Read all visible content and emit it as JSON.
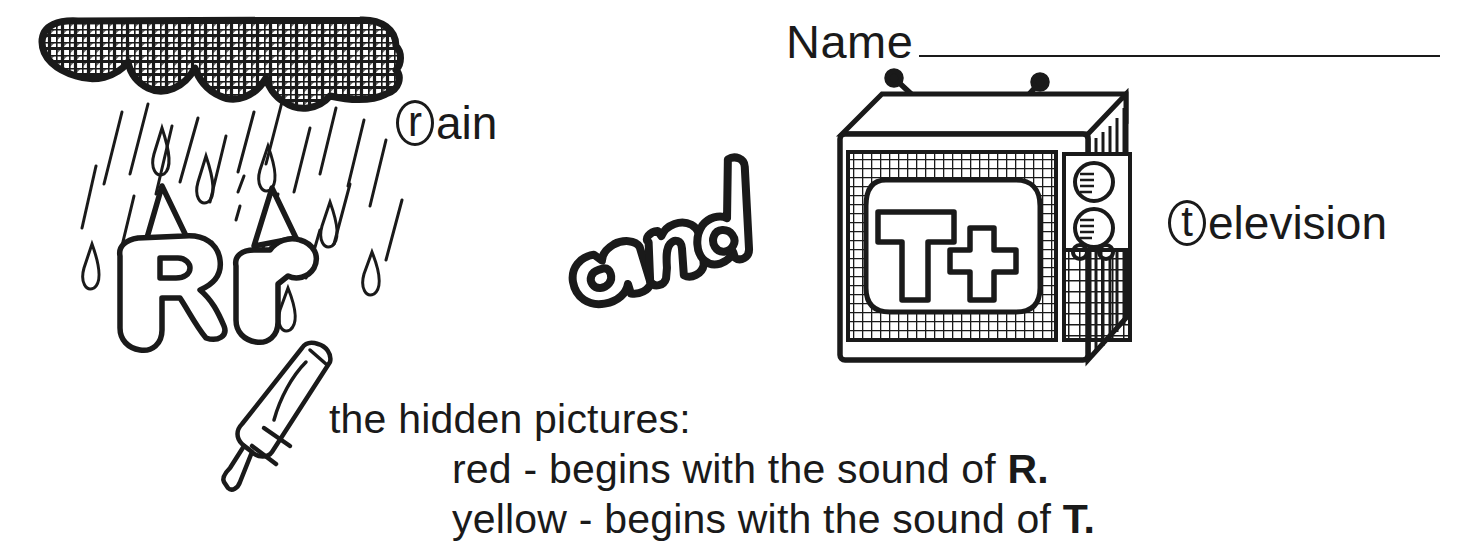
{
  "worksheet": {
    "name_field": {
      "label": "Name",
      "value": "",
      "rule": "________________________________"
    },
    "picture_labels": [
      {
        "id": "rain",
        "circled_letter": "r",
        "rest": "ain",
        "full": "rain"
      },
      {
        "id": "television",
        "circled_letter": "t",
        "rest": "elevision",
        "full": "television"
      }
    ],
    "connector_word": {
      "text": "and",
      "style": "bubble-outline"
    },
    "instructions": {
      "line1": "the hidden pictures:",
      "line2_color": "red",
      "line2_rest": " - begins with the sound of ",
      "line2_letter": "R.",
      "line3_color": "yellow",
      "line3_rest": " - begins with the sound of ",
      "line3_letter": "T."
    },
    "illustrations": [
      {
        "name": "rain-cloud",
        "depicts": "cross-hatched cloud with falling rain streaks and droplets"
      },
      {
        "name": "letters-R-and-r",
        "depicts": "bubble letters R and r wearing party hats"
      },
      {
        "name": "crayon",
        "depicts": "crayon tilted pointing down-left"
      },
      {
        "name": "television-set",
        "depicts": "television with rabbit-ear antenna, T t on screen, knobs and speaker grille"
      }
    ],
    "colors": {
      "ink": "#1a1a1a",
      "paper": "#ffffff"
    }
  }
}
